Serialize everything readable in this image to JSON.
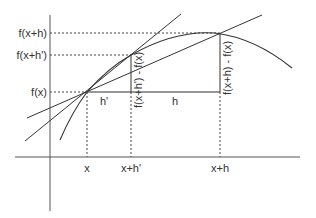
{
  "diagram": {
    "y_labels": {
      "fxh": "f(x+h)",
      "fxhp": "f(x+h')",
      "fx": "f(x)"
    },
    "x_labels": {
      "x": "x",
      "xhp": "x+h'",
      "xh": "x+h"
    },
    "segment_labels": {
      "hp": "h'",
      "h": "h"
    },
    "rise_labels": {
      "small": "f(x+h') - f(x)",
      "large": "f(x+h) - f(x)"
    },
    "colors": {
      "line": "#333333",
      "axis": "#555555",
      "background": "#ffffff"
    }
  }
}
